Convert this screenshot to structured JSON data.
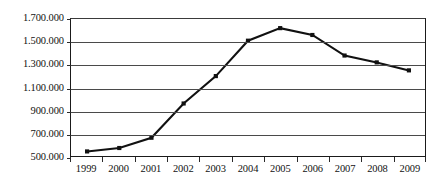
{
  "chart_data": {
    "type": "line",
    "title": "",
    "subtitle": "",
    "xlabel": "",
    "ylabel": "",
    "categories": [
      "1999",
      "2000",
      "2001",
      "2002",
      "2003",
      "2004",
      "2005",
      "2006",
      "2007",
      "2008",
      "2009"
    ],
    "values": [
      540000,
      570000,
      660000,
      960000,
      1200000,
      1510000,
      1620000,
      1560000,
      1380000,
      1320000,
      1250000
    ],
    "series": [
      {
        "name": "",
        "values": [
          540000,
          570000,
          660000,
          960000,
          1200000,
          1510000,
          1620000,
          1560000,
          1380000,
          1320000,
          1250000
        ]
      }
    ],
    "ylim": [
      500000,
      1700000
    ],
    "ytick_values": [
      500000,
      700000,
      900000,
      1100000,
      1300000,
      1500000,
      1700000
    ],
    "ytick_labels": [
      "500.000",
      "700.000",
      "900.000",
      "1.100.000",
      "1.300.000",
      "1.500.000",
      "1.700.000"
    ],
    "ytick_step": 200000,
    "xtick_labels": [
      "1999",
      "2000",
      "2001",
      "2002",
      "2003",
      "2004",
      "2005",
      "2006",
      "2007",
      "2008",
      "2009"
    ],
    "grid": true,
    "grid_axis": "y",
    "legend": false,
    "legend_position": "none",
    "marker": "square",
    "line_color": "#111111",
    "grid_color": "#4a4a4a",
    "axis_color": "#1a1a1a",
    "background_color": "#ffffff",
    "annotations": []
  }
}
